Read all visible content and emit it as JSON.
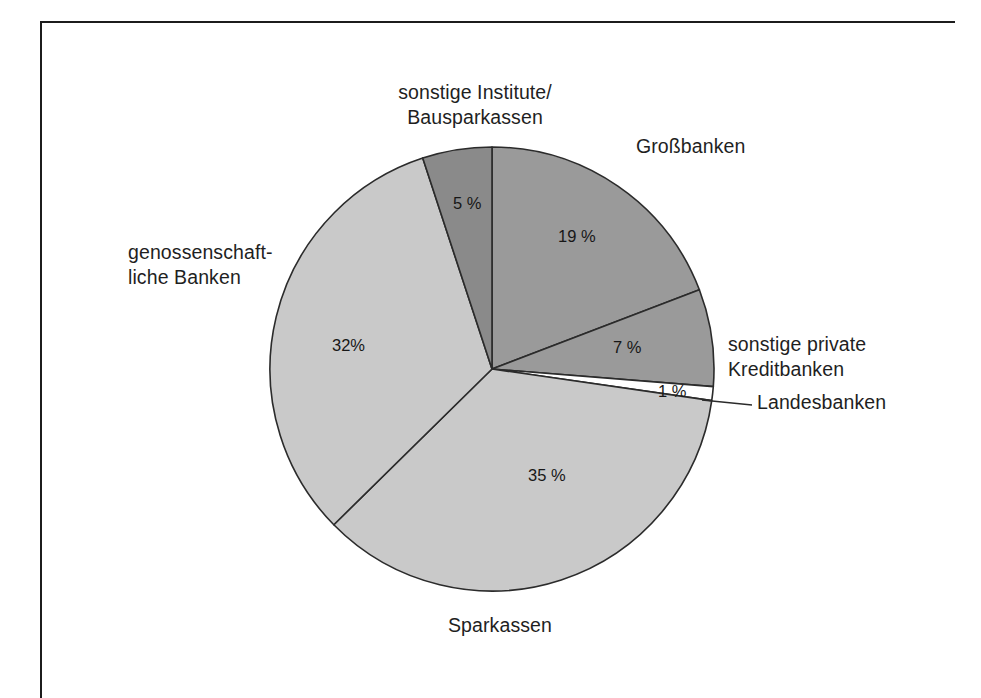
{
  "chart_data": {
    "type": "pie",
    "title": "",
    "subtitle": "",
    "xlabel": "",
    "ylabel": "",
    "legend_position": "callout-labels",
    "grid": false,
    "units": "%",
    "start_angle_deg": 0,
    "direction": "clockwise",
    "categories": [
      "Großbanken",
      "sonstige private Kreditbanken",
      "Landesbanken",
      "Sparkassen",
      "genossenschaftliche Banken",
      "sonstige Institute/Bausparkassen"
    ],
    "values": [
      19,
      7,
      1,
      35,
      32,
      5
    ],
    "slices": [
      {
        "label": "Großbanken",
        "label_line1": "Großbanken",
        "value": 19,
        "value_text": "19 %",
        "color": "#9a9a9a"
      },
      {
        "label": "sonstige private Kreditbanken",
        "label_line1": "sonstige private",
        "label_line2": "Kreditbanken",
        "value": 7,
        "value_text": "7 %",
        "color": "#9a9a9a"
      },
      {
        "label": "Landesbanken",
        "label_line1": "Landesbanken",
        "value": 1,
        "value_text": "1 %",
        "color": "#ffffff"
      },
      {
        "label": "Sparkassen",
        "label_line1": "Sparkassen",
        "value": 35,
        "value_text": "35 %",
        "color": "#c9c9c9"
      },
      {
        "label": "genossenschaftliche Banken",
        "label_line1": "genossenschaft-",
        "label_line2": "liche Banken",
        "value": 32,
        "value_text": "32%",
        "color": "#c9c9c9"
      },
      {
        "label": "sonstige Institute/Bausparkassen",
        "label_line1": "sonstige Institute/",
        "label_line2": "Bausparkassen",
        "value": 5,
        "value_text": "5 %",
        "color": "#8a8a8a"
      }
    ]
  },
  "labels": {
    "bausparkassen": "sonstige Institute/\nBausparkassen",
    "grossbanken": "Großbanken",
    "genossenschaftliche": "genossenschaft-\nliche Banken",
    "sonstige_private": "sonstige private\nKreditbanken",
    "landesbanken": "Landesbanken",
    "sparkassen": "Sparkassen"
  },
  "values": {
    "grossbanken": "19 %",
    "sonstige_private": "7 %",
    "landesbanken": "1 %",
    "sparkassen": "35 %",
    "genossenschaftliche": "32%",
    "bausparkassen": "5 %"
  },
  "colors": {
    "dark_gray": "#8a8a8a",
    "medium_gray": "#9a9a9a",
    "light_gray": "#c9c9c9",
    "white": "#ffffff",
    "stroke": "#2b2b2b",
    "frame": "#1c1c1c",
    "text": "#1f1f1f"
  },
  "geometry": {
    "center_x": 492,
    "center_y": 369,
    "radius": 222
  }
}
